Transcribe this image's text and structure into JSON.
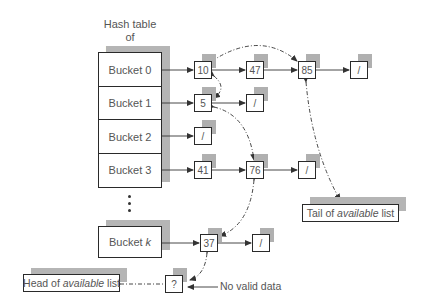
{
  "diagram": {
    "title_line1": "Hash table of",
    "title_line2_prefix": "buffers ",
    "title_line2_italic": "in-use",
    "buckets": [
      {
        "label": "Bucket 0"
      },
      {
        "label": "Bucket 1"
      },
      {
        "label": "Bucket 2"
      },
      {
        "label": "Bucket 3"
      }
    ],
    "bucket_k_prefix": "Bucket ",
    "bucket_k_italic": "k",
    "ellipsis": "vertical-dots",
    "nodes": {
      "b0_n1": "10",
      "b0_n2": "47",
      "b0_n3": "85",
      "b0_end": "/",
      "b1_n1": "5",
      "b1_end": "/",
      "b2_end": "/",
      "b3_n1": "41",
      "b3_n2": "76",
      "b3_end": "/",
      "bk_n1": "37",
      "bk_end": "/",
      "free": "?"
    },
    "head_label_prefix": "Head of ",
    "head_label_italic": "available",
    "head_label_suffix": " list",
    "tail_label_prefix": "Tail of ",
    "tail_label_italic": "available",
    "tail_label_suffix": " list",
    "no_valid_data": "No valid data",
    "colors": {
      "line": "#333333",
      "shadow": "#b5b5b5",
      "text": "#555555",
      "border": "#2a2a2a"
    }
  }
}
